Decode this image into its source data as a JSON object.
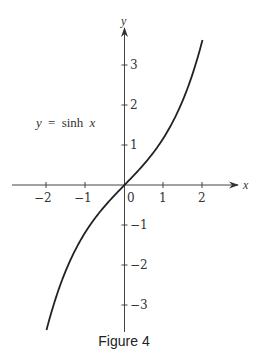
{
  "figure": {
    "caption": "Figure 4",
    "equation_label": {
      "y": "y",
      "eq": "=",
      "fn": "sinh",
      "x": "x"
    }
  },
  "chart_data": {
    "type": "line",
    "title": "",
    "function": "y = sinh x",
    "xlabel": "x",
    "ylabel": "y",
    "xlim": [
      -2.2,
      2.9
    ],
    "ylim": [
      -3.7,
      3.9
    ],
    "grid": false,
    "x_ticks": [
      -2,
      -1,
      0,
      1,
      2
    ],
    "x_tick_labels": [
      "−2",
      "−1",
      "0",
      "1",
      "2"
    ],
    "y_ticks": [
      -3,
      -2,
      -1,
      1,
      2,
      3
    ],
    "y_tick_labels": [
      "−3",
      "−2",
      "−1",
      "1",
      "2",
      "3"
    ],
    "series": [
      {
        "name": "y = sinh x",
        "x": [
          -2,
          -1.5,
          -1,
          -0.5,
          0,
          0.5,
          1,
          1.5,
          2
        ],
        "y": [
          -3.627,
          -2.129,
          -1.175,
          -0.521,
          0,
          0.521,
          1.175,
          2.129,
          3.627
        ]
      }
    ],
    "annotations": [
      "y = sinh x"
    ],
    "caption": "Figure 4"
  }
}
